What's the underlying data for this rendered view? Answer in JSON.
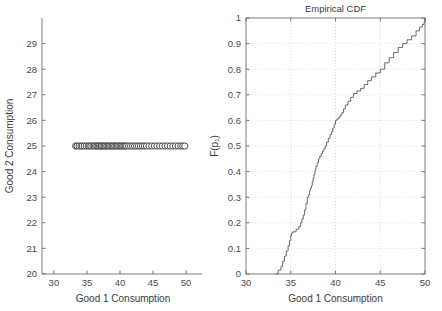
{
  "figure": {
    "width": 442,
    "height": 311,
    "background": "#ffffff",
    "axis_color": "#6e6e6e",
    "grid_color": "#c9c9c9",
    "line_color": "#5a5a5a",
    "marker_fill": "#ffffff",
    "marker_stroke": "#3a3a3a",
    "footer_ghost_text": ""
  },
  "chart_data": [
    {
      "id": "scatter-good1-good2",
      "type": "scatter",
      "title": "",
      "xlabel": "Good 1 Consumption",
      "ylabel": "Good 2 Consumption",
      "xlim": [
        28.2,
        51.5
      ],
      "ylim": [
        20,
        30
      ],
      "xticks": [
        30,
        35,
        40,
        45,
        50
      ],
      "yticks": [
        20,
        21,
        22,
        23,
        24,
        25,
        26,
        27,
        28,
        29
      ],
      "xtick_labels": [
        "30",
        "35",
        "40",
        "45",
        "50"
      ],
      "ytick_labels": [
        "20",
        "21",
        "22",
        "23",
        "24",
        "25",
        "26",
        "27",
        "28",
        "29"
      ],
      "grid": false,
      "box": false,
      "marker": "circle-open",
      "marker_size": 3.1,
      "x": [
        33.3,
        33.5,
        33.8,
        34.1,
        34.3,
        34.6,
        34.9,
        35.2,
        35.4,
        35.6,
        35.9,
        36.1,
        36.3,
        36.5,
        36.7,
        36.9,
        37.1,
        37.2,
        37.4,
        37.6,
        37.8,
        38.0,
        38.2,
        38.4,
        38.6,
        38.8,
        39.0,
        39.2,
        39.4,
        39.6,
        39.8,
        40.0,
        40.2,
        40.4,
        40.6,
        40.8,
        41.0,
        41.3,
        41.6,
        41.9,
        42.2,
        42.5,
        42.8,
        43.1,
        43.4,
        43.7,
        44.0,
        44.4,
        44.8,
        45.2,
        45.6,
        46.0,
        46.4,
        46.8,
        47.2,
        47.6,
        48.0,
        48.4,
        48.8,
        49.2,
        49.5,
        49.8
      ],
      "y_constant": 25,
      "note": "all observations lie on the horizontal line Good 2 = 25"
    },
    {
      "id": "empirical-cdf",
      "type": "line",
      "title": "Empirical CDF",
      "xlabel": "Good 1 Consumption",
      "ylabel": "F(p₁)",
      "xlim": [
        30,
        50
      ],
      "ylim": [
        0,
        1
      ],
      "xticks": [
        30,
        35,
        40,
        45,
        50
      ],
      "yticks": [
        0,
        0.1,
        0.2,
        0.3,
        0.4,
        0.5,
        0.6,
        0.7,
        0.8,
        0.9,
        1
      ],
      "xtick_labels": [
        "30",
        "35",
        "40",
        "45",
        "50"
      ],
      "ytick_labels": [
        "0",
        "0.1",
        "0.2",
        "0.3",
        "0.4",
        "0.5",
        "0.6",
        "0.7",
        "0.8",
        "0.9",
        "1"
      ],
      "grid": true,
      "box": true,
      "step": "post",
      "x": [
        33.35,
        33.6,
        33.9,
        34.1,
        34.3,
        34.5,
        34.7,
        34.85,
        35.0,
        35.1,
        35.25,
        35.6,
        35.9,
        36.1,
        36.25,
        36.4,
        36.55,
        36.7,
        36.85,
        37.0,
        37.1,
        37.2,
        37.3,
        37.4,
        37.5,
        37.6,
        37.7,
        37.8,
        37.95,
        38.1,
        38.25,
        38.4,
        38.55,
        38.7,
        38.85,
        39.0,
        39.2,
        39.4,
        39.55,
        39.7,
        39.85,
        40.0,
        40.15,
        40.3,
        40.5,
        40.7,
        40.9,
        41.1,
        41.4,
        41.7,
        42.0,
        42.4,
        42.8,
        43.2,
        43.6,
        44.0,
        44.5,
        45.0,
        45.5,
        46.0,
        46.5,
        47.0,
        47.5,
        48.0,
        48.5,
        49.0,
        49.4,
        49.7,
        49.9
      ],
      "y": [
        0.0,
        0.015,
        0.03,
        0.05,
        0.07,
        0.09,
        0.11,
        0.13,
        0.15,
        0.16,
        0.165,
        0.175,
        0.185,
        0.2,
        0.215,
        0.23,
        0.25,
        0.275,
        0.3,
        0.31,
        0.325,
        0.335,
        0.345,
        0.36,
        0.375,
        0.39,
        0.405,
        0.42,
        0.435,
        0.45,
        0.46,
        0.47,
        0.48,
        0.49,
        0.5,
        0.515,
        0.53,
        0.545,
        0.555,
        0.57,
        0.585,
        0.6,
        0.605,
        0.61,
        0.62,
        0.63,
        0.645,
        0.66,
        0.675,
        0.69,
        0.705,
        0.715,
        0.725,
        0.74,
        0.755,
        0.77,
        0.785,
        0.8,
        0.825,
        0.845,
        0.865,
        0.885,
        0.9,
        0.915,
        0.93,
        0.95,
        0.965,
        0.975,
        0.985
      ]
    }
  ]
}
